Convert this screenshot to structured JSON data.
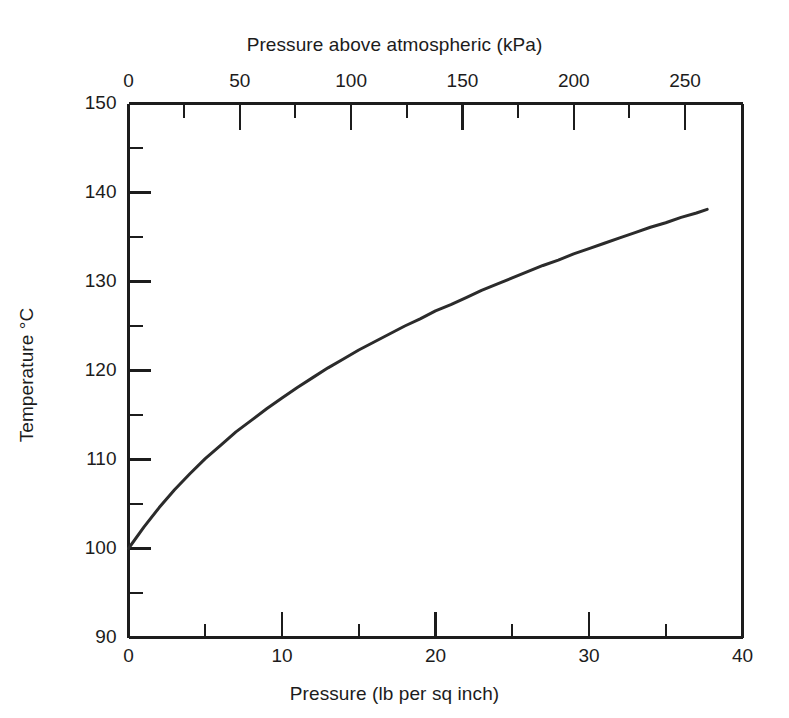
{
  "chart_data": {
    "type": "line",
    "title": "",
    "xlabel": "Pressure (lb per sq inch)",
    "ylabel": "Temperature °C",
    "secondary_xlabel": "Pressure above atmospheric (kPa)",
    "xlim": [
      0,
      40
    ],
    "ylim": [
      90,
      150
    ],
    "secondary_xlim": [
      0,
      275.79
    ],
    "grid": false,
    "legend": null,
    "x_major_ticks": [
      0,
      10,
      20,
      30,
      40
    ],
    "x_minor_ticks": [
      5,
      15,
      25,
      35
    ],
    "x_ticklabels": [
      "0",
      "10",
      "20",
      "30",
      "40"
    ],
    "y_major_ticks": [
      90,
      100,
      110,
      120,
      130,
      140,
      150
    ],
    "y_minor_ticks": [
      95,
      105,
      115,
      125,
      135,
      145
    ],
    "y_ticklabels": [
      "90",
      "100",
      "110",
      "120",
      "130",
      "140",
      "150"
    ],
    "secondary_x_major_ticks": [
      0,
      50,
      100,
      150,
      200,
      250
    ],
    "secondary_x_minor_ticks": [
      25,
      75,
      125,
      175,
      225
    ],
    "secondary_x_ticklabels": [
      "0",
      "50",
      "100",
      "150",
      "200",
      "250"
    ],
    "series": [
      {
        "name": "Saturated steam temperature",
        "color": "#2b2b2b",
        "line_width": 3,
        "x": [
          0,
          1,
          2,
          3,
          4,
          5,
          6,
          7,
          8,
          9,
          10,
          11,
          12,
          13,
          14,
          15,
          16,
          17,
          18,
          19,
          20,
          21,
          22,
          23,
          24,
          25,
          26,
          27,
          28,
          29,
          30,
          31,
          32,
          33,
          34,
          35,
          36,
          37,
          37.7
        ],
        "y": [
          100.0,
          102.4,
          104.6,
          106.6,
          108.4,
          110.1,
          111.6,
          113.1,
          114.4,
          115.7,
          116.9,
          118.1,
          119.2,
          120.3,
          121.3,
          122.3,
          123.2,
          124.1,
          125.0,
          125.8,
          126.7,
          127.4,
          128.2,
          129.0,
          129.7,
          130.4,
          131.1,
          131.8,
          132.4,
          133.1,
          133.7,
          134.3,
          134.9,
          135.5,
          136.1,
          136.6,
          137.2,
          137.7,
          138.1
        ]
      }
    ],
    "annotations": []
  },
  "figure": {
    "background_color": "#ffffff",
    "frame_color": "#1c1c1c",
    "text_color": "#1c1c1c"
  }
}
